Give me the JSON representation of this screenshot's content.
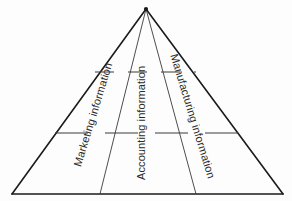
{
  "diagram": {
    "type": "pyramid",
    "shape": "triangle",
    "background_color": "#fdfdfd",
    "stroke_color": "#1a1a1a",
    "text_color": "#2b2b2b",
    "apex": {
      "x": 146,
      "y": 9
    },
    "base_left": {
      "x": 12,
      "y": 194
    },
    "base_right": {
      "x": 283,
      "y": 194
    },
    "columns": [
      {
        "id": "marketing",
        "label": "Marketing information",
        "rotation_deg": -73,
        "base_x_start": 12,
        "base_x_end": 100
      },
      {
        "id": "accounting",
        "label": "Accounting information",
        "rotation_deg": -90,
        "base_x_start": 100,
        "base_x_end": 196
      },
      {
        "id": "manufacturing",
        "label": "Manufacturing information",
        "rotation_deg": 73,
        "base_x_start": 196,
        "base_x_end": 283
      }
    ],
    "divider_lines": [
      {
        "id": "upper-divider",
        "y": 72,
        "x_start": 95,
        "x_end": 196,
        "style": "dashed"
      },
      {
        "id": "lower-divider",
        "y": 133,
        "x_start": 55,
        "x_end": 238,
        "style": "dashed"
      }
    ],
    "internal_lines": [
      {
        "id": "left-divider",
        "from_x": 146,
        "from_y": 9,
        "to_x": 100,
        "to_y": 194
      },
      {
        "id": "right-divider",
        "from_x": 146,
        "from_y": 9,
        "to_x": 196,
        "to_y": 194
      }
    ]
  }
}
